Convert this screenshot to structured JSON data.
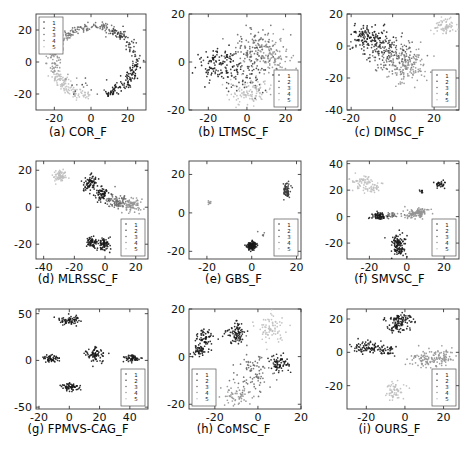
{
  "figure": {
    "title": "",
    "rows": 3,
    "cols": 3,
    "legend_entries": [
      "1",
      "2",
      "3",
      "4",
      "5"
    ],
    "marker": "dot",
    "cluster_colors": [
      "#1a1a1a",
      "#3d3d3d",
      "#6b6b6b",
      "#949494",
      "#bfbfbf"
    ]
  },
  "chart_data": [
    {
      "type": "scatter",
      "panel": "a",
      "title": "(a) COR_F",
      "xlabel": "",
      "ylabel": "",
      "xlim": [
        -30,
        30
      ],
      "ylim": [
        -30,
        30
      ],
      "xticks": [
        -20,
        0,
        20
      ],
      "yticks": [
        -20,
        0,
        20
      ],
      "xtick_labels": [
        "-20",
        "0",
        "20"
      ],
      "ytick_labels": [
        "-20",
        "0",
        "20"
      ],
      "grid": false,
      "legend": {
        "entries": [
          "1",
          "2",
          "3",
          "4",
          "5"
        ],
        "position": "top-left"
      },
      "shape": "ring",
      "n_points": 480,
      "series": [
        {
          "name": "1",
          "color": "#1a1a1a",
          "n": 96
        },
        {
          "name": "2",
          "color": "#3d3d3d",
          "n": 96
        },
        {
          "name": "3",
          "color": "#6b6b6b",
          "n": 96
        },
        {
          "name": "4",
          "color": "#949494",
          "n": 96
        },
        {
          "name": "5",
          "color": "#bfbfbf",
          "n": 96
        }
      ]
    },
    {
      "type": "scatter",
      "panel": "b",
      "title": "(b) LTMSC_F",
      "xlabel": "",
      "ylabel": "",
      "xlim": [
        -30,
        28
      ],
      "ylim": [
        -20,
        20
      ],
      "xticks": [
        -20,
        0,
        20
      ],
      "yticks": [
        -20,
        0,
        20
      ],
      "xtick_labels": [
        "-20",
        "0",
        "20"
      ],
      "ytick_labels": [
        "-20",
        "0",
        "20"
      ],
      "grid": false,
      "legend": {
        "entries": [
          "1",
          "2",
          "3",
          "4",
          "5"
        ],
        "position": "bottom-right"
      },
      "shape": "blob",
      "n_points": 500,
      "series": [
        {
          "name": "1",
          "color": "#1a1a1a",
          "n": 100
        },
        {
          "name": "2",
          "color": "#3d3d3d",
          "n": 100
        },
        {
          "name": "3",
          "color": "#6b6b6b",
          "n": 100
        },
        {
          "name": "4",
          "color": "#949494",
          "n": 100
        },
        {
          "name": "5",
          "color": "#bfbfbf",
          "n": 100
        }
      ]
    },
    {
      "type": "scatter",
      "panel": "c",
      "title": "(c) DIMSC_F",
      "xlabel": "",
      "ylabel": "",
      "xlim": [
        -22,
        32
      ],
      "ylim": [
        -40,
        20
      ],
      "xticks": [
        -20,
        0,
        20
      ],
      "yticks": [
        -40,
        -20,
        0,
        20
      ],
      "xtick_labels": [
        "-20",
        "0",
        "20"
      ],
      "ytick_labels": [
        "-40",
        "-20",
        "0",
        "20"
      ],
      "grid": false,
      "legend": {
        "entries": [
          "1",
          "2",
          "3",
          "4",
          "5"
        ],
        "position": "bottom-right"
      },
      "shape": "diagonal-bands",
      "n_points": 500,
      "series": [
        {
          "name": "1",
          "color": "#1a1a1a",
          "n": 100
        },
        {
          "name": "2",
          "color": "#3d3d3d",
          "n": 100
        },
        {
          "name": "3",
          "color": "#6b6b6b",
          "n": 100
        },
        {
          "name": "4",
          "color": "#949494",
          "n": 100
        },
        {
          "name": "5",
          "color": "#bfbfbf",
          "n": 100
        }
      ]
    },
    {
      "type": "scatter",
      "panel": "d",
      "title": "(d) MLRSSC_F",
      "xlabel": "",
      "ylabel": "",
      "xlim": [
        -45,
        28
      ],
      "ylim": [
        -28,
        25
      ],
      "xticks": [
        -40,
        -20,
        0,
        20
      ],
      "yticks": [
        -20,
        0,
        20
      ],
      "xtick_labels": [
        "-40",
        "-20",
        "0",
        "20"
      ],
      "ytick_labels": [
        "-20",
        "0",
        "20"
      ],
      "grid": false,
      "legend": {
        "entries": [
          "1",
          "2",
          "3",
          "4",
          "5"
        ],
        "position": "bottom-right"
      },
      "shape": "clusters",
      "n_points": 430,
      "series": [
        {
          "name": "1",
          "color": "#1a1a1a",
          "n": 86
        },
        {
          "name": "2",
          "color": "#3d3d3d",
          "n": 86
        },
        {
          "name": "3",
          "color": "#6b6b6b",
          "n": 86
        },
        {
          "name": "4",
          "color": "#949494",
          "n": 86
        },
        {
          "name": "5",
          "color": "#bfbfbf",
          "n": 86
        }
      ]
    },
    {
      "type": "scatter",
      "panel": "e",
      "title": "(e) GBS_F",
      "xlabel": "",
      "ylabel": "",
      "xlim": [
        -28,
        22
      ],
      "ylim": [
        -24,
        27
      ],
      "xticks": [
        -20,
        0,
        20
      ],
      "yticks": [
        -20,
        0,
        20
      ],
      "xtick_labels": [
        "-20",
        "0",
        "20"
      ],
      "ytick_labels": [
        "-20",
        "0",
        "20"
      ],
      "grid": false,
      "legend": {
        "entries": [
          "1",
          "2",
          "3",
          "4",
          "5"
        ],
        "position": "bottom-right"
      },
      "shape": "degenerate",
      "n_points": 260,
      "series": [
        {
          "name": "1",
          "color": "#1a1a1a",
          "n": 52
        },
        {
          "name": "2",
          "color": "#3d3d3d",
          "n": 52
        },
        {
          "name": "3",
          "color": "#6b6b6b",
          "n": 52
        },
        {
          "name": "4",
          "color": "#949494",
          "n": 52
        },
        {
          "name": "5",
          "color": "#bfbfbf",
          "n": 52
        }
      ]
    },
    {
      "type": "scatter",
      "panel": "f",
      "title": "(f) SMVSC_F",
      "xlabel": "",
      "ylabel": "",
      "xlim": [
        -32,
        28
      ],
      "ylim": [
        -32,
        42
      ],
      "xticks": [
        -20,
        0,
        20
      ],
      "yticks": [
        -20,
        0,
        20,
        40
      ],
      "xtick_labels": [
        "-20",
        "0",
        "20"
      ],
      "ytick_labels": [
        "-20",
        "0",
        "20",
        "40"
      ],
      "grid": false,
      "legend": {
        "entries": [
          "1",
          "2",
          "3",
          "4",
          "5"
        ],
        "position": "bottom-right"
      },
      "shape": "clusters",
      "n_points": 420,
      "series": [
        {
          "name": "1",
          "color": "#1a1a1a",
          "n": 84
        },
        {
          "name": "2",
          "color": "#3d3d3d",
          "n": 84
        },
        {
          "name": "3",
          "color": "#6b6b6b",
          "n": 84
        },
        {
          "name": "4",
          "color": "#949494",
          "n": 84
        },
        {
          "name": "5",
          "color": "#bfbfbf",
          "n": 84
        }
      ]
    },
    {
      "type": "scatter",
      "panel": "g",
      "title": "(g) FPMVS-CAG_F",
      "xlabel": "",
      "ylabel": "",
      "xlim": [
        -22,
        52
      ],
      "ylim": [
        -52,
        55
      ],
      "xticks": [
        -20,
        0,
        20,
        40
      ],
      "yticks": [
        -50,
        0,
        50
      ],
      "xtick_labels": [
        "-20",
        "0",
        "20",
        "40"
      ],
      "ytick_labels": [
        "-50",
        "0",
        "50"
      ],
      "grid": false,
      "legend": {
        "entries": [
          "1",
          "2",
          "3",
          "4",
          "5"
        ],
        "position": "bottom-right"
      },
      "shape": "compact-clusters",
      "n_points": 330,
      "series": [
        {
          "name": "1",
          "color": "#1a1a1a",
          "n": 66
        },
        {
          "name": "2",
          "color": "#3d3d3d",
          "n": 66
        },
        {
          "name": "3",
          "color": "#6b6b6b",
          "n": 66
        },
        {
          "name": "4",
          "color": "#949494",
          "n": 66
        },
        {
          "name": "5",
          "color": "#bfbfbf",
          "n": 66
        }
      ]
    },
    {
      "type": "scatter",
      "panel": "h",
      "title": "(h) CoMSC_F",
      "xlabel": "",
      "ylabel": "",
      "xlim": [
        -32,
        20
      ],
      "ylim": [
        -22,
        20
      ],
      "xticks": [
        -20,
        0,
        20
      ],
      "yticks": [
        -20,
        0,
        20
      ],
      "xtick_labels": [
        "-20",
        "0",
        "20"
      ],
      "ytick_labels": [
        "-20",
        "0",
        "20"
      ],
      "grid": false,
      "legend": {
        "entries": [
          "1",
          "2",
          "3",
          "4",
          "5"
        ],
        "position": "bottom-left"
      },
      "shape": "clusters",
      "n_points": 470,
      "series": [
        {
          "name": "1",
          "color": "#1a1a1a",
          "n": 94
        },
        {
          "name": "2",
          "color": "#3d3d3d",
          "n": 94
        },
        {
          "name": "3",
          "color": "#6b6b6b",
          "n": 94
        },
        {
          "name": "4",
          "color": "#949494",
          "n": 94
        },
        {
          "name": "5",
          "color": "#bfbfbf",
          "n": 94
        }
      ]
    },
    {
      "type": "scatter",
      "panel": "i",
      "title": "(i) OURS_F",
      "xlabel": "",
      "ylabel": "",
      "xlim": [
        -30,
        28
      ],
      "ylim": [
        -34,
        26
      ],
      "xticks": [
        -20,
        0,
        20
      ],
      "yticks": [
        -20,
        0,
        20
      ],
      "xtick_labels": [
        "-20",
        "0",
        "20"
      ],
      "ytick_labels": [
        "-20",
        "0",
        "20"
      ],
      "grid": false,
      "legend": {
        "entries": [
          "1",
          "2",
          "3",
          "4",
          "5"
        ],
        "position": "bottom-right"
      },
      "shape": "well-separated-clusters",
      "n_points": 430,
      "series": [
        {
          "name": "1",
          "color": "#1a1a1a",
          "n": 86
        },
        {
          "name": "2",
          "color": "#3d3d3d",
          "n": 86
        },
        {
          "name": "3",
          "color": "#6b6b6b",
          "n": 86
        },
        {
          "name": "4",
          "color": "#949494",
          "n": 86
        },
        {
          "name": "5",
          "color": "#bfbfbf",
          "n": 86
        }
      ]
    }
  ]
}
